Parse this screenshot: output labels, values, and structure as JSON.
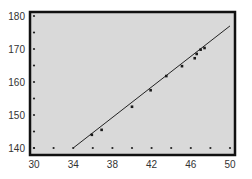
{
  "chart_data": {
    "type": "scatter",
    "title": "",
    "xlabel": "",
    "ylabel": "",
    "xlim": [
      30,
      50
    ],
    "ylim": [
      140,
      180
    ],
    "x_ticks": [
      30,
      34,
      38,
      42,
      46,
      50
    ],
    "y_ticks": [
      140,
      150,
      160,
      170,
      180
    ],
    "grid": false,
    "legend": null,
    "background_color": "#d9d9d9",
    "frame_color": "#111111",
    "series": [
      {
        "name": "data",
        "kind": "points",
        "x": [
          35.9,
          36.9,
          40.0,
          41.9,
          43.5,
          45.1,
          46.4,
          46.6,
          47.0,
          47.4
        ],
        "y": [
          144.0,
          145.5,
          152.5,
          157.5,
          161.8,
          164.8,
          167.2,
          168.5,
          169.8,
          170.3
        ]
      },
      {
        "name": "fit-line",
        "kind": "line",
        "x": [
          34,
          50
        ],
        "y": [
          140,
          177
        ]
      }
    ],
    "axis_dot_markers": {
      "y_axis_at_x30": [
        140,
        145,
        150,
        155,
        160,
        165,
        170,
        175,
        180
      ],
      "x_axis_at_y140": [
        30,
        32,
        34,
        36,
        38,
        40,
        42,
        44,
        46,
        48,
        50
      ]
    }
  }
}
